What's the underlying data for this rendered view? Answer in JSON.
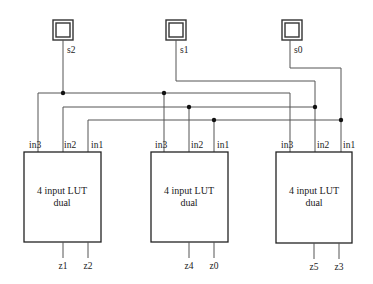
{
  "diagram": {
    "type": "circuit-schematic",
    "inputs": [
      {
        "id": "s2",
        "label": "s2"
      },
      {
        "id": "s1",
        "label": "s1"
      },
      {
        "id": "s0",
        "label": "s0"
      }
    ],
    "blocks": [
      {
        "id": "lut-a",
        "title_line1": "4 input LUT",
        "title_line2": "dual",
        "pins": [
          {
            "label": "in3",
            "net": "s2"
          },
          {
            "label": "in2",
            "net": "s1"
          },
          {
            "label": "in1",
            "net": "s0"
          }
        ],
        "outputs": [
          {
            "label": "z1"
          },
          {
            "label": "z2"
          }
        ]
      },
      {
        "id": "lut-b",
        "title_line1": "4 input LUT",
        "title_line2": "dual",
        "pins": [
          {
            "label": "in3",
            "net": "s2"
          },
          {
            "label": "in2",
            "net": "s1"
          },
          {
            "label": "in1",
            "net": "s0"
          }
        ],
        "outputs": [
          {
            "label": "z4"
          },
          {
            "label": "z0"
          }
        ]
      },
      {
        "id": "lut-c",
        "title_line1": "4 input LUT",
        "title_line2": "dual",
        "pins": [
          {
            "label": "in3",
            "net": "s2"
          },
          {
            "label": "in2",
            "net": "s1"
          },
          {
            "label": "in1",
            "net": "s0"
          }
        ],
        "outputs": [
          {
            "label": "z5"
          },
          {
            "label": "z3"
          }
        ]
      }
    ],
    "colors": {
      "wire": "#555555",
      "outline": "#222222",
      "junction": "#111111",
      "background": "#ffffff"
    }
  }
}
